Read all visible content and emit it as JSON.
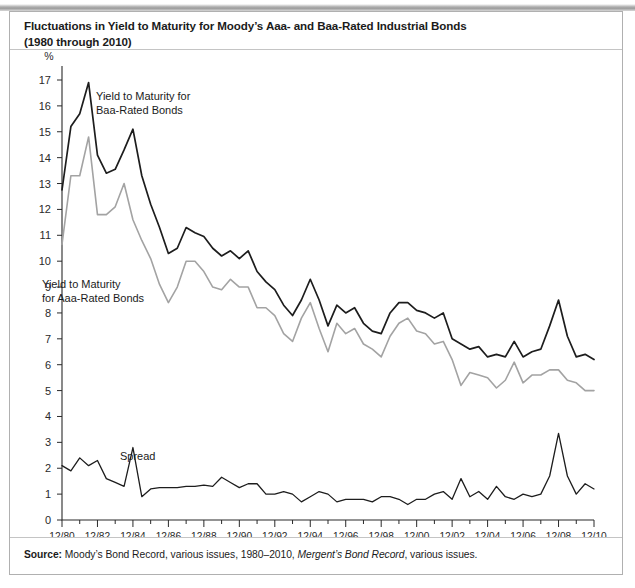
{
  "figure": {
    "title": "Fluctuations in Yield to Maturity for Moody’s Aaa- and Baa-Rated Industrial Bonds (1980 through 2010)",
    "title_line1": "Fluctuations in Yield to Maturity for Moody’s Aaa- and Baa-Rated Industrial Bonds",
    "title_line2": "(1980 through 2010)",
    "source_label": "Source:",
    "source_text_a": " Moody’s Bond Record, various issues, 1980–2010, ",
    "source_text_italic": "Mergent’s Bond Record",
    "source_text_b": ", various issues."
  },
  "annotations": {
    "baa_label_line1": "Yield to Maturity for",
    "baa_label_line2": "Baa-Rated Bonds",
    "aaa_label_line1": "Yield to Maturity",
    "aaa_label_line2": "for Aaa-Rated Bonds",
    "spread_label": "Spread"
  },
  "colors": {
    "baa_line": "#1d1d1d",
    "aaa_line": "#a3a3a3",
    "spread_line": "#1d1d1d",
    "axis": "#2a2a2a",
    "frame": "#b0b0b0"
  },
  "chart_data": {
    "type": "line",
    "title": "Fluctuations in Yield to Maturity for Moody’s Aaa- and Baa-Rated Industrial Bonds (1980 through 2010)",
    "xlabel": "Date",
    "ylabel": "%",
    "ylim": [
      0,
      17
    ],
    "yticks": [
      0,
      1,
      2,
      3,
      4,
      5,
      6,
      7,
      8,
      9,
      10,
      11,
      12,
      13,
      14,
      15,
      16,
      17
    ],
    "ytick_labels": [
      "0",
      "1",
      "2",
      "3",
      "4",
      "5",
      "6",
      "7",
      "8",
      "9",
      "10",
      "11",
      "12",
      "13",
      "14",
      "15",
      "16",
      "17"
    ],
    "grid": false,
    "legend": "annotations-inline",
    "xtick_labels": [
      "12/80",
      "12/82",
      "12/84",
      "12/86",
      "12/88",
      "12/90",
      "12/92",
      "12/94",
      "12/96",
      "12/98",
      "12/00",
      "12/02",
      "12/04",
      "12/06",
      "12/08",
      "12/10"
    ],
    "minor_tick_interval_years": 1,
    "x": [
      "12/80",
      "6/81",
      "12/81",
      "6/82",
      "12/82",
      "6/83",
      "12/83",
      "6/84",
      "12/84",
      "6/85",
      "12/85",
      "6/86",
      "12/86",
      "6/87",
      "12/87",
      "6/88",
      "12/88",
      "6/89",
      "12/89",
      "6/90",
      "12/90",
      "6/91",
      "12/91",
      "6/92",
      "12/92",
      "6/93",
      "12/93",
      "6/94",
      "12/94",
      "6/95",
      "12/95",
      "6/96",
      "12/96",
      "6/97",
      "12/97",
      "6/98",
      "12/98",
      "6/99",
      "12/99",
      "6/00",
      "12/00",
      "6/01",
      "12/01",
      "6/02",
      "12/02",
      "6/03",
      "12/03",
      "6/04",
      "12/04",
      "6/05",
      "12/05",
      "6/06",
      "12/06",
      "6/07",
      "12/07",
      "6/08",
      "12/08",
      "6/09",
      "12/09",
      "6/10",
      "12/10"
    ],
    "series": [
      {
        "name": "Yield to Maturity for Baa-Rated Bonds",
        "color": "#1d1d1d",
        "values": [
          12.75,
          15.2,
          15.7,
          16.9,
          14.1,
          13.4,
          13.55,
          14.3,
          15.1,
          13.3,
          12.2,
          11.3,
          10.3,
          10.5,
          11.3,
          11.1,
          10.95,
          10.5,
          10.2,
          10.4,
          10.1,
          10.4,
          9.6,
          9.2,
          8.9,
          8.3,
          7.9,
          8.5,
          9.3,
          8.5,
          7.5,
          8.3,
          8.0,
          8.2,
          7.6,
          7.3,
          7.2,
          8.0,
          8.4,
          8.4,
          8.1,
          8.0,
          7.8,
          8.0,
          7.0,
          6.8,
          6.6,
          6.7,
          6.3,
          6.4,
          6.3,
          6.9,
          6.3,
          6.5,
          6.6,
          7.5,
          8.5,
          7.1,
          6.3,
          6.4,
          6.2
        ]
      },
      {
        "name": "Yield to Maturity for Aaa-Rated Bonds",
        "color": "#a3a3a3",
        "values": [
          10.65,
          13.3,
          13.3,
          14.8,
          11.8,
          11.8,
          12.1,
          13.0,
          11.6,
          10.8,
          10.1,
          9.1,
          8.4,
          9.0,
          10.0,
          10.0,
          9.6,
          9.0,
          8.9,
          9.3,
          9.0,
          9.0,
          8.2,
          8.2,
          7.9,
          7.2,
          6.9,
          7.8,
          8.4,
          7.4,
          6.5,
          7.6,
          7.2,
          7.4,
          6.8,
          6.6,
          6.3,
          7.1,
          7.6,
          7.8,
          7.3,
          7.2,
          6.8,
          6.9,
          6.2,
          5.2,
          5.7,
          5.6,
          5.5,
          5.1,
          5.4,
          6.1,
          5.3,
          5.6,
          5.6,
          5.8,
          5.8,
          5.4,
          5.3,
          5.0,
          5.0
        ]
      },
      {
        "name": "Spread",
        "color": "#1d1d1d",
        "values": [
          2.1,
          1.9,
          2.4,
          2.1,
          2.3,
          1.6,
          1.45,
          1.3,
          2.8,
          0.9,
          1.2,
          1.25,
          1.25,
          1.25,
          1.3,
          1.3,
          1.35,
          1.3,
          1.65,
          1.45,
          1.25,
          1.4,
          1.4,
          1.0,
          1.0,
          1.1,
          1.0,
          0.7,
          0.9,
          1.1,
          1.0,
          0.7,
          0.8,
          0.8,
          0.8,
          0.7,
          0.9,
          0.9,
          0.8,
          0.6,
          0.8,
          0.8,
          1.0,
          1.1,
          0.8,
          1.6,
          0.9,
          1.1,
          0.8,
          1.3,
          0.9,
          0.8,
          1.0,
          0.9,
          1.0,
          1.7,
          3.35,
          1.7,
          1.0,
          1.4,
          1.2
        ]
      }
    ]
  }
}
